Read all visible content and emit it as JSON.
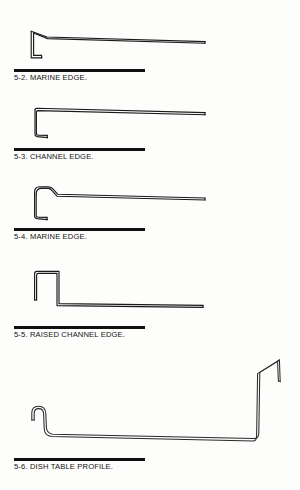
{
  "page": {
    "kind": "technical-reference-plate",
    "background_color": "#fdfdfc",
    "ink_color": "#141414",
    "width": 300,
    "height": 490
  },
  "figures": [
    {
      "id": "fig-5-2",
      "number": "5-2.",
      "name": "MARINE EDGE.",
      "caption": "5-2. MARINE EDGE.",
      "profile_type": "marine-edge",
      "description": "Raised lip at left turning down into a short return, sloping into a long flat deck running to the right.",
      "rule": {
        "x": 14,
        "y": 69,
        "width": 131,
        "height": 2.6
      },
      "caption_pos": {
        "x": 14,
        "y": 74
      }
    },
    {
      "id": "fig-5-3",
      "number": "5-3.",
      "name": "CHANNEL EDGE.",
      "caption": "5-3. CHANNEL EDGE.",
      "profile_type": "channel-edge",
      "description": "Flat deck with a square downturn at the left forming a channel with a small outward foot.",
      "rule": {
        "x": 14,
        "y": 148,
        "width": 131,
        "height": 2.6
      },
      "caption_pos": {
        "x": 14,
        "y": 153
      }
    },
    {
      "id": "fig-5-4",
      "number": "5-4.",
      "name": "MARINE EDGE.",
      "caption": "5-4. MARINE EDGE.",
      "profile_type": "marine-edge-rounded",
      "description": "Rounded raised lip at left stepping down to the deck, with a downturned return and foot.",
      "rule": {
        "x": 14,
        "y": 228,
        "width": 131,
        "height": 2.6
      },
      "caption_pos": {
        "x": 14,
        "y": 233
      }
    },
    {
      "id": "fig-5-5",
      "number": "5-5.",
      "name": "RAISED CHANNEL EDGE.",
      "caption": "5-5. RAISED CHANNEL EDGE.",
      "profile_type": "raised-channel-edge",
      "description": "Tall square raised rib at the left rising from a short leg, dropping to a long flat deck.",
      "rule": {
        "x": 14,
        "y": 326,
        "width": 131,
        "height": 2.6
      },
      "caption_pos": {
        "x": 14,
        "y": 331
      }
    },
    {
      "id": "fig-5-6",
      "number": "5-6.",
      "name": "DISH TABLE PROFILE.",
      "caption": "5-6. DISH TABLE PROFILE.",
      "profile_type": "dish-table-profile",
      "description": "Rolled J-hook front edge at left, long dished deck, rising to a tall backsplash at right with a small angled return at the top.",
      "rule": {
        "x": 14,
        "y": 458,
        "width": 131,
        "height": 2.6
      },
      "caption_pos": {
        "x": 14,
        "y": 463
      }
    }
  ]
}
